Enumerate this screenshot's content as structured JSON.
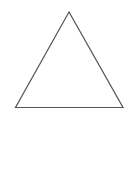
{
  "diagram": {
    "shape": "triangle",
    "fill": "none",
    "stroke": "#555555",
    "stroke_width": 1.2,
    "background": "#ffffff",
    "vertices": [
      {
        "x": 69,
        "y": 12
      },
      {
        "x": 15.5,
        "y": 107.5
      },
      {
        "x": 123,
        "y": 107.5
      }
    ]
  }
}
